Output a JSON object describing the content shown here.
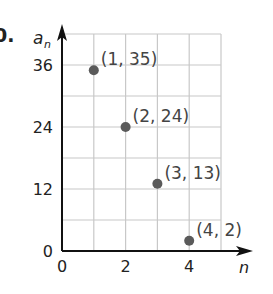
{
  "problem_number": "0.",
  "chart_data": {
    "type": "scatter",
    "title": "",
    "xlabel": "n",
    "ylabel": "a_n",
    "ylabel_main": "a",
    "ylabel_sub": "n",
    "xlim": [
      0,
      5
    ],
    "ylim": [
      0,
      42
    ],
    "x_ticks": [
      0,
      2,
      4
    ],
    "y_ticks": [
      0,
      12,
      24,
      36
    ],
    "x_tick_labels": [
      "0",
      "2",
      "4"
    ],
    "y_tick_labels": [
      "0",
      "12",
      "24",
      "36"
    ],
    "grid": true,
    "grid_x_step": 1,
    "grid_y_step": 6,
    "legend": null,
    "points": [
      {
        "x": 1,
        "y": 35,
        "label": "(1, 35)"
      },
      {
        "x": 2,
        "y": 24,
        "label": "(2, 24)"
      },
      {
        "x": 3,
        "y": 13,
        "label": "(3, 13)"
      },
      {
        "x": 4,
        "y": 2,
        "label": "(4, 2)"
      }
    ],
    "colors": {
      "point": "#5a5a5a",
      "grid": "#c8c8c8",
      "axis": "#111111",
      "text": "#222222",
      "label": "#444444"
    }
  }
}
